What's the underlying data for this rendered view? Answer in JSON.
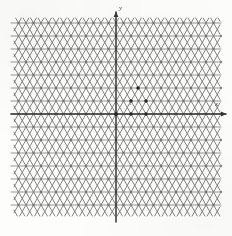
{
  "figure": {
    "background_color": "#fdfdfb",
    "lattice_color": "#6d6d6d",
    "axis_color": "#2b2b2b",
    "emphasis_point_color": "#1f1f1f"
  },
  "labels": {
    "y_axis": "y",
    "x_axis": "x",
    "unit_tick": "1"
  },
  "chart_data": {
    "type": "scatter",
    "xlabel": "x",
    "ylabel": "y",
    "grid": true,
    "legend": null,
    "lattice": {
      "kind": "triangular",
      "origin_px": [
        116,
        114
      ],
      "basis_px": [
        [
          15,
          0
        ],
        [
          7.5,
          -13
        ]
      ],
      "spacing_px": 15,
      "row_height_px": 13,
      "columns": 15,
      "rows": 16,
      "line_families": [
        {
          "name": "horizontal",
          "angle_deg": 0
        },
        {
          "name": "diagonal-up",
          "angle_deg": 60
        },
        {
          "name": "diagonal-down",
          "angle_deg": -60
        }
      ]
    },
    "axes": {
      "x": {
        "from_px": [
          11,
          114
        ],
        "to_px": [
          226,
          114
        ],
        "arrow": "right"
      },
      "y": {
        "from_px": [
          116,
          222
        ],
        "to_px": [
          116,
          12
        ],
        "arrow": "up"
      }
    },
    "bounds_px": {
      "left": 14,
      "top": 18,
      "right": 220,
      "bottom": 216
    },
    "emphasis_points_px": [
      [
        131,
        114
      ],
      [
        146,
        114
      ],
      [
        131,
        101
      ],
      [
        146,
        101
      ],
      [
        138,
        88
      ],
      [
        116,
        114
      ]
    ]
  }
}
